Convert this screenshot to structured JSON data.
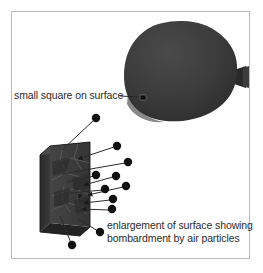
{
  "figure": {
    "background_color": "#ffffff",
    "frame_color": "#b9b9b9",
    "ink_color": "#2b2b2b",
    "balloon_color": "#3a3a3a",
    "slab_color": "#3c3c3c",
    "particle_color": "#111111"
  },
  "labels": {
    "square_on_surface": "small square on surface",
    "caption_line_1": "enlargement of surface showing",
    "caption_line_2": "bombardment by air particles"
  },
  "objects": {
    "balloon": {
      "name": "balloon",
      "center_x": 182,
      "center_y": 72,
      "radius_x": 56,
      "radius_y": 50,
      "nozzle_x": 243,
      "nozzle_y": 77
    },
    "surface_marker": {
      "name": "small-square-on-surface",
      "x": 142,
      "y": 97,
      "size": 5
    },
    "slab": {
      "name": "enlarged-surface-slab",
      "x": 40,
      "y": 142,
      "width": 46,
      "height": 88
    }
  },
  "particles": [
    {
      "x": 96,
      "y": 118
    },
    {
      "x": 117,
      "y": 146
    },
    {
      "x": 128,
      "y": 162
    },
    {
      "x": 96,
      "y": 175
    },
    {
      "x": 116,
      "y": 176
    },
    {
      "x": 105,
      "y": 189
    },
    {
      "x": 126,
      "y": 186
    },
    {
      "x": 113,
      "y": 199
    },
    {
      "x": 112,
      "y": 209
    },
    {
      "x": 100,
      "y": 232
    },
    {
      "x": 72,
      "y": 245
    }
  ],
  "particle_count": 11
}
